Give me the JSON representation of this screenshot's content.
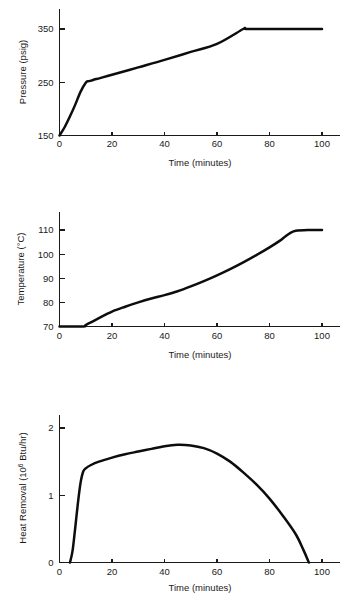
{
  "figure": {
    "name": "process-trend-charts",
    "panel_count": 3
  },
  "charts": [
    {
      "id": "pressure",
      "title": "",
      "type": "line",
      "xlabel": "Time (minutes)",
      "ylabel": "Pressure (psig)",
      "ylabel_plain": "Pressure (psig)",
      "xticks": [
        0,
        20,
        40,
        60,
        80,
        100
      ],
      "xtick_labels": [
        "0",
        "20",
        "40",
        "60",
        "80",
        "100"
      ],
      "yticks": [
        150,
        250,
        350
      ],
      "ytick_labels": [
        "150",
        "250",
        "350"
      ],
      "xlim": [
        0,
        100
      ],
      "ylim": [
        150,
        370
      ],
      "grid": false,
      "legend": "none",
      "series": [
        {
          "name": "Pressure",
          "x": [
            0,
            2,
            4,
            6,
            8,
            10,
            11,
            12,
            14,
            20,
            30,
            40,
            50,
            60,
            70,
            71,
            80,
            90,
            100
          ],
          "y": [
            150,
            166,
            186,
            208,
            232,
            249,
            252,
            253,
            256,
            264,
            278,
            292,
            307,
            322,
            350,
            350,
            350,
            350,
            350
          ]
        }
      ]
    },
    {
      "id": "temperature",
      "title": "",
      "type": "line",
      "xlabel": "Time (minutes)",
      "ylabel": "Temperature (°C)",
      "ylabel_plain": "Temperature (degC)",
      "xticks": [
        0,
        20,
        40,
        60,
        80,
        100
      ],
      "xtick_labels": [
        "0",
        "20",
        "40",
        "60",
        "80",
        "100"
      ],
      "yticks": [
        70,
        80,
        90,
        100,
        110
      ],
      "ytick_labels": [
        "70",
        "80",
        "90",
        "100",
        "110"
      ],
      "xlim": [
        0,
        100
      ],
      "ylim": [
        70,
        116
      ],
      "grid": false,
      "legend": "none",
      "series": [
        {
          "name": "Temperature",
          "x": [
            0,
            9,
            10,
            15,
            20,
            25,
            30,
            35,
            40,
            45,
            50,
            55,
            60,
            65,
            70,
            75,
            80,
            84,
            86,
            88,
            90,
            95,
            100
          ],
          "y": [
            70,
            70,
            70.6,
            73.5,
            76.2,
            78.2,
            80.0,
            81.6,
            83.0,
            84.6,
            86.6,
            88.8,
            91.2,
            93.8,
            96.6,
            99.6,
            102.8,
            105.6,
            107.3,
            108.8,
            109.7,
            110,
            110
          ]
        }
      ]
    },
    {
      "id": "heat-removal",
      "title": "",
      "type": "line",
      "xlabel": "Time (minutes)",
      "ylabel_prefix": "Heat Removal (10",
      "ylabel_sup": "6",
      "ylabel_suffix": " Btu/hr)",
      "ylabel_plain": "Heat Removal (10^6 Btu/hr)",
      "xticks": [
        0,
        20,
        40,
        60,
        80,
        100
      ],
      "xtick_labels": [
        "0",
        "20",
        "40",
        "60",
        "80",
        "100"
      ],
      "yticks": [
        0,
        1,
        2
      ],
      "ytick_labels": [
        "0",
        "1",
        "2"
      ],
      "xlim": [
        0,
        100
      ],
      "ylim": [
        0,
        2.2
      ],
      "grid": false,
      "legend": "none",
      "series": [
        {
          "name": "Heat Removal",
          "x": [
            4,
            5,
            6,
            7,
            8,
            9,
            10,
            12,
            15,
            20,
            25,
            30,
            35,
            40,
            45,
            50,
            55,
            60,
            65,
            70,
            75,
            80,
            85,
            90,
            93,
            95
          ],
          "y": [
            0,
            0.18,
            0.52,
            0.88,
            1.18,
            1.35,
            1.4,
            1.45,
            1.5,
            1.56,
            1.61,
            1.65,
            1.69,
            1.73,
            1.75,
            1.74,
            1.7,
            1.62,
            1.5,
            1.34,
            1.16,
            0.95,
            0.7,
            0.42,
            0.18,
            0.0
          ]
        }
      ]
    }
  ],
  "chart_data": [
    {
      "type": "line",
      "title": "",
      "xlabel": "Time (minutes)",
      "ylabel": "Pressure (psig)",
      "xlim": [
        0,
        100
      ],
      "ylim": [
        150,
        370
      ],
      "xticks": [
        0,
        20,
        40,
        60,
        80,
        100
      ],
      "yticks": [
        150,
        250,
        350
      ],
      "grid": false,
      "legend": "none",
      "series": [
        {
          "name": "Pressure",
          "x": [
            0,
            2,
            4,
            6,
            8,
            10,
            11,
            12,
            14,
            20,
            30,
            40,
            50,
            60,
            70,
            71,
            80,
            90,
            100
          ],
          "values": [
            150,
            166,
            186,
            208,
            232,
            249,
            252,
            253,
            256,
            264,
            278,
            292,
            307,
            322,
            350,
            350,
            350,
            350,
            350
          ]
        }
      ]
    },
    {
      "type": "line",
      "title": "",
      "xlabel": "Time (minutes)",
      "ylabel": "Temperature (°C)",
      "xlim": [
        0,
        100
      ],
      "ylim": [
        70,
        116
      ],
      "xticks": [
        0,
        20,
        40,
        60,
        80,
        100
      ],
      "yticks": [
        70,
        80,
        90,
        100,
        110
      ],
      "grid": false,
      "legend": "none",
      "series": [
        {
          "name": "Temperature",
          "x": [
            0,
            9,
            10,
            15,
            20,
            25,
            30,
            35,
            40,
            45,
            50,
            55,
            60,
            65,
            70,
            75,
            80,
            84,
            86,
            88,
            90,
            95,
            100
          ],
          "values": [
            70,
            70,
            70.6,
            73.5,
            76.2,
            78.2,
            80.0,
            81.6,
            83.0,
            84.6,
            86.6,
            88.8,
            91.2,
            93.8,
            96.6,
            99.6,
            102.8,
            105.6,
            107.3,
            108.8,
            109.7,
            110,
            110
          ]
        }
      ]
    },
    {
      "type": "line",
      "title": "",
      "xlabel": "Time (minutes)",
      "ylabel": "Heat Removal (10^6 Btu/hr)",
      "xlim": [
        0,
        100
      ],
      "ylim": [
        0,
        2.2
      ],
      "xticks": [
        0,
        20,
        40,
        60,
        80,
        100
      ],
      "yticks": [
        0,
        1,
        2
      ],
      "grid": false,
      "legend": "none",
      "series": [
        {
          "name": "Heat Removal",
          "x": [
            4,
            5,
            6,
            7,
            8,
            9,
            10,
            12,
            15,
            20,
            25,
            30,
            35,
            40,
            45,
            50,
            55,
            60,
            65,
            70,
            75,
            80,
            85,
            90,
            93,
            95
          ],
          "values": [
            0,
            0.18,
            0.52,
            0.88,
            1.18,
            1.35,
            1.4,
            1.45,
            1.5,
            1.56,
            1.61,
            1.65,
            1.69,
            1.73,
            1.75,
            1.74,
            1.7,
            1.62,
            1.5,
            1.34,
            1.16,
            0.95,
            0.7,
            0.42,
            0.18,
            0.0
          ]
        }
      ]
    }
  ]
}
